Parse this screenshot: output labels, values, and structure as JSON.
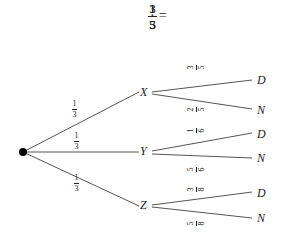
{
  "equation": {
    "term1": {
      "num": "1",
      "den": "3"
    },
    "operator": "·",
    "term2": {
      "num": "3",
      "den": "5"
    },
    "equals": "=",
    "result": {
      "num": "1",
      "den": "5"
    }
  },
  "tree": {
    "root": {
      "label": ""
    },
    "first_level": [
      {
        "node": "X",
        "prob": {
          "num": "1",
          "den": "3"
        },
        "children": [
          {
            "node": "D",
            "prob": {
              "num": "3",
              "den": "5"
            }
          },
          {
            "node": "N",
            "prob": {
              "num": "2",
              "den": "5"
            }
          }
        ]
      },
      {
        "node": "Y",
        "prob": {
          "num": "1",
          "den": "3"
        },
        "children": [
          {
            "node": "D",
            "prob": {
              "num": "1",
              "den": "6"
            }
          },
          {
            "node": "N",
            "prob": {
              "num": "5",
              "den": "6"
            }
          }
        ]
      },
      {
        "node": "Z",
        "prob": {
          "num": "1",
          "den": "3"
        },
        "children": [
          {
            "node": "D",
            "prob": {
              "num": "3",
              "den": "8"
            }
          },
          {
            "node": "N",
            "prob": {
              "num": "5",
              "den": "8"
            }
          }
        ]
      }
    ]
  },
  "colors": {
    "line": "#555555",
    "text": "#222222",
    "root_dot": "#000000"
  }
}
